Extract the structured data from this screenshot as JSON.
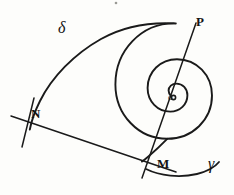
{
  "figure": {
    "kind": "hand-drawn-geometry-sketch",
    "background_color": "#fdfdfb",
    "ink_color": "#1a1a1a",
    "width": 234,
    "height": 195,
    "labels": {
      "point_p": "P",
      "point_n": "N",
      "point_m": "M",
      "pole": "o",
      "arc_delta": "δ",
      "arc_gamma": "γ"
    },
    "elements": {
      "spiral_name": "spiral-curve",
      "secant_name": "line-p-m",
      "chord_name": "line-n-m",
      "tick_name": "tick-at-n",
      "tail_name": "curve-tail-gamma"
    }
  },
  "geometry": {
    "spiral_path": "M 171 96 C 169.5 94.4 168.6 92.6 168.6 90.6 C 168.6 86.6 172.0 83.6 176.4 83.6 C 182.6 83.6 187.4 88.4 187.4 95.2 C 187.4 104.4 180.0 111.6 170.2 111.6 C 157.6 111.6 147.6 101.4 147.6 88.0 C 147.6 71.8 160.4 59.2 177.0 59.2 C 196.6 59.2 212.0 75.0 212.0 95.6 C 212.0 119.6 192.4 138.8 167.2 138.8 C 138.6 138.8 115.4 114.8 115.4 84.4 C 115.4 50.4 141.4 23.4 174.0 23.4 C 174.6 23.4 175.2 23.4 175.8 23.5",
    "spiral_outer_arm": "M 174.0 23.4 C 150.0 22.2 123.0 26.6 101.0 39.0 C 74.0 54.2 52.0 77.0 40.0 101.0 C 34.6 111.8 31.2 122.0 29.8 129.6",
    "spiral_lower_arm": "M 167.2 138.8 C 160.0 146.2 153.6 152.0 148.4 156.4 C 146.0 158.4 143.8 160.2 142.0 161.6",
    "secant_line": {
      "x1": 196.0,
      "y1": 23.0,
      "x2": 142.0,
      "y2": 178.0
    },
    "chord_line": {
      "x1": 11.0,
      "y1": 116.0,
      "x2": 176.0,
      "y2": 172.0
    },
    "tick_line": {
      "x1": 34.0,
      "y1": 98.0,
      "x2": 22.0,
      "y2": 147.0
    },
    "tail_curve": "M 146.0 169.0 C 160.0 176.0 180.0 178.0 197.0 174.0 C 208.0 171.2 215.0 167.0 219.0 162.0",
    "pole_center": {
      "cx": 173.5,
      "cy": 97.5,
      "r": 2.1
    },
    "speck": {
      "cx": 116.0,
      "cy": 3.0,
      "r": 1.3
    }
  }
}
